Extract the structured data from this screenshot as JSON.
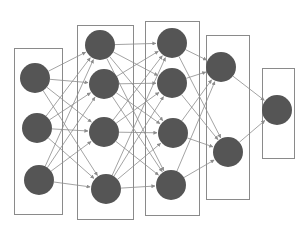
{
  "diagram": {
    "type": "neural-network",
    "background": "#ffffff",
    "colors": {
      "node_fill": "#555555",
      "box_stroke": "#8a8a8a",
      "edge_stroke": "#8c8c8c"
    },
    "node_radius": 15,
    "layers": [
      {
        "name": "input-layer",
        "box": {
          "x": 14,
          "y": 48,
          "w": 48,
          "h": 166
        },
        "nodes": [
          {
            "x": 35,
            "y": 78
          },
          {
            "x": 37,
            "y": 128
          },
          {
            "x": 39,
            "y": 180
          }
        ]
      },
      {
        "name": "hidden-layer-1",
        "box": {
          "x": 77,
          "y": 25,
          "w": 56,
          "h": 194
        },
        "nodes": [
          {
            "x": 100,
            "y": 45
          },
          {
            "x": 104,
            "y": 84
          },
          {
            "x": 104,
            "y": 132
          },
          {
            "x": 106,
            "y": 189
          }
        ]
      },
      {
        "name": "hidden-layer-2",
        "box": {
          "x": 145,
          "y": 21,
          "w": 54,
          "h": 194
        },
        "nodes": [
          {
            "x": 172,
            "y": 43
          },
          {
            "x": 172,
            "y": 83
          },
          {
            "x": 173,
            "y": 133
          },
          {
            "x": 171,
            "y": 185
          }
        ]
      },
      {
        "name": "hidden-layer-3",
        "box": {
          "x": 206,
          "y": 35,
          "w": 43,
          "h": 164
        },
        "nodes": [
          {
            "x": 221,
            "y": 67
          },
          {
            "x": 228,
            "y": 152
          }
        ]
      },
      {
        "name": "output-layer",
        "box": {
          "x": 262,
          "y": 68,
          "w": 32,
          "h": 90
        },
        "nodes": [
          {
            "x": 277,
            "y": 110
          }
        ]
      }
    ]
  }
}
